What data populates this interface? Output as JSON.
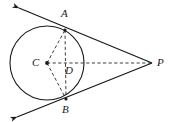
{
  "figure": {
    "type": "geometry-diagram",
    "width": 169,
    "height": 122,
    "background_color": "#ffffff",
    "stroke_color": "#1a1a1a"
  },
  "labels": {
    "A": "A",
    "B": "B",
    "C": "C",
    "D": "D",
    "P": "P"
  },
  "points": {
    "A": {
      "x": 65,
      "y": 30
    },
    "B": {
      "x": 66,
      "y": 99
    },
    "C": {
      "x": 47,
      "y": 63
    },
    "D": {
      "x": 70,
      "y": 63
    },
    "P": {
      "x": 152,
      "y": 63
    }
  },
  "label_positions": {
    "A": {
      "x": 61,
      "y": 8
    },
    "B": {
      "x": 62,
      "y": 104
    },
    "C": {
      "x": 32,
      "y": 57
    },
    "D": {
      "x": 65,
      "y": 65
    },
    "P": {
      "x": 157,
      "y": 57
    }
  },
  "circle": {
    "center_x": 47,
    "center_y": 63,
    "radius": 37,
    "stroke_width": 1.1,
    "style": "solid"
  },
  "solid_segments": [
    {
      "name": "tangent-line-upper",
      "x1": 19,
      "y1": 8,
      "x2": 152,
      "y2": 63,
      "arrow_start": true
    },
    {
      "name": "tangent-line-lower",
      "x1": 17,
      "y1": 117,
      "x2": 152,
      "y2": 63,
      "arrow_start": true
    }
  ],
  "dashed_segments": [
    {
      "name": "radius-CA",
      "x1": 47,
      "y1": 63,
      "x2": 65,
      "y2": 30
    },
    {
      "name": "radius-CB",
      "x1": 47,
      "y1": 63,
      "x2": 66,
      "y2": 99
    },
    {
      "name": "chord-AB",
      "x1": 65,
      "y1": 30,
      "x2": 66,
      "y2": 99
    },
    {
      "name": "segment-CP",
      "x1": 47,
      "y1": 63,
      "x2": 152,
      "y2": 63
    }
  ],
  "dots": [
    {
      "name": "center-dot-C",
      "x": 47,
      "y": 63,
      "r": 1.9
    },
    {
      "name": "tangent-dot-A",
      "x": 65,
      "y": 30,
      "r": 1.6
    },
    {
      "name": "tangent-dot-B",
      "x": 66,
      "y": 99,
      "r": 1.6
    }
  ]
}
